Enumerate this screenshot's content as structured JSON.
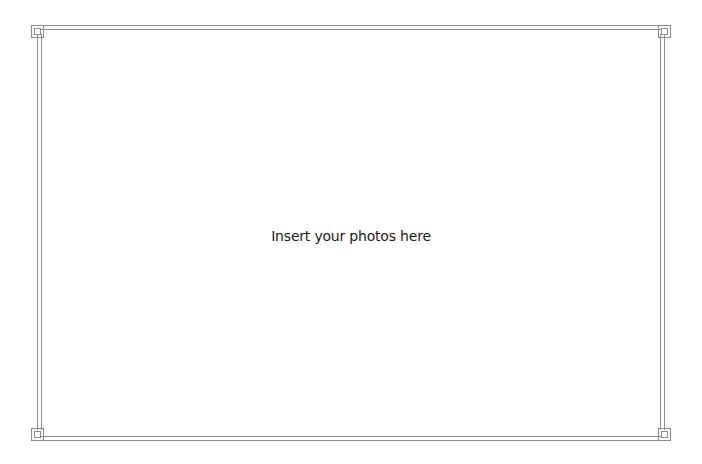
{
  "placeholder": {
    "text": "Insert your photos here"
  },
  "frame": {
    "style": "double-line border with Greek key corner ornaments",
    "line_color": "#8c8c8c",
    "background": "#ffffff",
    "corners": [
      "top-left",
      "top-right",
      "bottom-left",
      "bottom-right"
    ]
  }
}
